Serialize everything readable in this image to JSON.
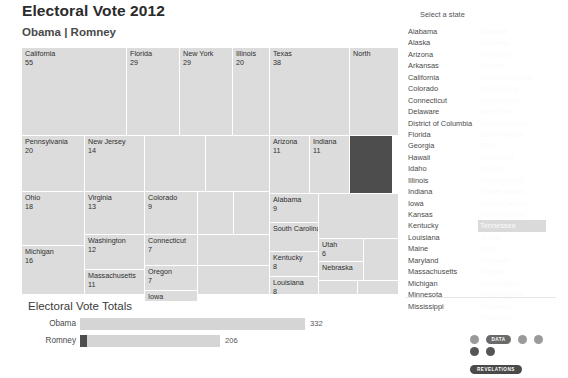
{
  "header": {
    "title": "Electoral Vote 2012",
    "subtitle": "Obama | Romney"
  },
  "state_panel": {
    "title": "Select a state",
    "hovered_state": "Tennessee",
    "column_a": [
      "Alabama",
      "Alaska",
      "Arizona",
      "Arkansas",
      "California",
      "Colorado",
      "Connecticut",
      "Delaware",
      "District of Columbia",
      "Florida",
      "Georgia",
      "Hawaii",
      "Idaho",
      "Illinois",
      "Indiana",
      "Iowa",
      "Kansas",
      "Kentucky",
      "Louisiana",
      "Maine",
      "Maryland",
      "Massachusetts",
      "Michigan",
      "Minnesota",
      "Mississippi"
    ],
    "column_b": [
      "Missouri",
      "Montana",
      "Nebraska",
      "Nevada",
      "New Hampshire",
      "New Jersey",
      "New Mexico",
      "New York",
      "North Carolina",
      "North Dakota",
      "Ohio",
      "Oklahoma",
      "Oregon",
      "Pennsylvania",
      "Rhode Island",
      "South Carolina",
      "South Dakota",
      "Tennessee",
      "Texas",
      "Utah",
      "Vermont",
      "Virginia",
      "Washington",
      "West Virginia",
      "Wisconsin",
      "Wyoming"
    ]
  },
  "totals": {
    "title": "Electoral Vote Totals",
    "rows": [
      {
        "name": "Obama",
        "value": "332",
        "votes": 332,
        "highlight": 0
      },
      {
        "name": "Romney",
        "value": "206",
        "votes": 206,
        "highlight": 11
      }
    ],
    "max_votes": 332
  },
  "logo": {
    "line1": "DATA",
    "line2": "REVELATIONS"
  },
  "chart_data": {
    "type": "treemap",
    "title": "Electoral Vote 2012",
    "subtitle": "Obama | Romney",
    "value_label": "Electoral Votes",
    "selected": "Tennessee",
    "cells": [
      {
        "label": "California",
        "value": "55",
        "x": 0,
        "y": 0,
        "w": 104,
        "h": 87,
        "selected": false
      },
      {
        "label": "Florida",
        "value": "29",
        "x": 105,
        "y": 0,
        "w": 52,
        "h": 87,
        "selected": false
      },
      {
        "label": "New York",
        "value": "29",
        "x": 158,
        "y": 0,
        "w": 52,
        "h": 87,
        "selected": false
      },
      {
        "label": "Illinois",
        "value": "20",
        "x": 211,
        "y": 0,
        "w": 36,
        "h": 87,
        "selected": false
      },
      {
        "label": "Texas",
        "value": "38",
        "x": 248,
        "y": 0,
        "w": 79,
        "h": 87,
        "selected": false
      },
      {
        "label": "North",
        "value": "",
        "x": 328,
        "y": 0,
        "w": 48,
        "h": 87,
        "selected": false
      },
      {
        "label": "Pennsylvania",
        "value": "20",
        "x": 0,
        "y": 88,
        "w": 62,
        "h": 55,
        "selected": false
      },
      {
        "label": "New Jersey",
        "value": "14",
        "x": 63,
        "y": 88,
        "w": 59,
        "h": 55,
        "selected": false
      },
      {
        "label": "",
        "value": "",
        "x": 123,
        "y": 88,
        "w": 60,
        "h": 55,
        "selected": false
      },
      {
        "label": "",
        "value": "",
        "x": 184,
        "y": 88,
        "w": 63,
        "h": 55,
        "selected": false
      },
      {
        "label": "Ohio",
        "value": "18",
        "x": 0,
        "y": 144,
        "w": 62,
        "h": 53,
        "selected": false
      },
      {
        "label": "Virginia",
        "value": "13",
        "x": 63,
        "y": 144,
        "w": 59,
        "h": 42,
        "selected": false
      },
      {
        "label": "Colorado",
        "value": "9",
        "x": 123,
        "y": 144,
        "w": 52,
        "h": 42,
        "selected": false
      },
      {
        "label": "",
        "value": "",
        "x": 176,
        "y": 144,
        "w": 35,
        "h": 42,
        "selected": false
      },
      {
        "label": "",
        "value": "",
        "x": 212,
        "y": 144,
        "w": 35,
        "h": 42,
        "selected": false
      },
      {
        "label": "Washington",
        "value": "12",
        "x": 63,
        "y": 187,
        "w": 59,
        "h": 34,
        "selected": false
      },
      {
        "label": "Connecticut",
        "value": "7",
        "x": 123,
        "y": 187,
        "w": 52,
        "h": 30,
        "selected": false
      },
      {
        "label": "",
        "value": "",
        "x": 176,
        "y": 187,
        "w": 71,
        "h": 30,
        "selected": false
      },
      {
        "label": "Michigan",
        "value": "16",
        "x": 0,
        "y": 198,
        "w": 62,
        "h": 48,
        "selected": false
      },
      {
        "label": "Massachusetts",
        "value": "11",
        "x": 63,
        "y": 222,
        "w": 59,
        "h": 24,
        "selected": false
      },
      {
        "label": "Oregon",
        "value": "7",
        "x": 123,
        "y": 218,
        "w": 52,
        "h": 24,
        "selected": false
      },
      {
        "label": "Iowa",
        "value": "",
        "x": 123,
        "y": 243,
        "w": 52,
        "h": 10,
        "selected": false
      },
      {
        "label": "",
        "value": "",
        "x": 176,
        "y": 218,
        "w": 71,
        "h": 28,
        "selected": false
      },
      {
        "label": "Arizona",
        "value": "11",
        "x": 248,
        "y": 88,
        "w": 39,
        "h": 57,
        "selected": false
      },
      {
        "label": "Indiana",
        "value": "11",
        "x": 288,
        "y": 88,
        "w": 39,
        "h": 57,
        "selected": false
      },
      {
        "label": "Tennessee",
        "value": "11",
        "x": 328,
        "y": 88,
        "w": 42,
        "h": 57,
        "selected": true
      },
      {
        "label": "Alabama",
        "value": "9",
        "x": 248,
        "y": 146,
        "w": 48,
        "h": 28,
        "selected": false
      },
      {
        "label": "South Carolina",
        "value": "",
        "x": 248,
        "y": 175,
        "w": 48,
        "h": 28,
        "selected": false
      },
      {
        "label": "Kentucky",
        "value": "8",
        "x": 248,
        "y": 204,
        "w": 48,
        "h": 24,
        "selected": false
      },
      {
        "label": "Louisiana",
        "value": "8",
        "x": 248,
        "y": 229,
        "w": 48,
        "h": 17,
        "selected": false
      },
      {
        "label": "",
        "value": "",
        "x": 297,
        "y": 146,
        "w": 79,
        "h": 44,
        "selected": false
      },
      {
        "label": "Utah",
        "value": "6",
        "x": 297,
        "y": 191,
        "w": 44,
        "h": 22,
        "selected": false
      },
      {
        "label": "Nebraska",
        "value": "",
        "x": 297,
        "y": 214,
        "w": 44,
        "h": 18,
        "selected": false
      },
      {
        "label": "",
        "value": "",
        "x": 342,
        "y": 191,
        "w": 34,
        "h": 41,
        "selected": false
      },
      {
        "label": "",
        "value": "",
        "x": 297,
        "y": 233,
        "w": 38,
        "h": 13,
        "selected": false
      },
      {
        "label": "",
        "value": "",
        "x": 336,
        "y": 233,
        "w": 40,
        "h": 13,
        "selected": false
      }
    ]
  }
}
